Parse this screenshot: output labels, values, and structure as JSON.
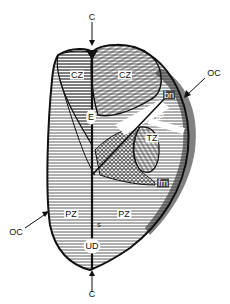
{
  "figure": {
    "type": "anatomical-diagram",
    "colors": {
      "outline": "#111111",
      "hatch": "#333333",
      "fibromuscular": "#6b6b6b",
      "background": "#ffffff"
    },
    "labels": {
      "c_top": "C",
      "c_bottom": "C",
      "oc_right": "OC",
      "oc_left": "OC",
      "cz_left": "CZ",
      "cz_right": "CZ",
      "e": "E",
      "bn": "bn",
      "s_upper": "s",
      "up": "UP",
      "tz": "TZ",
      "fm": "fm",
      "pz_left": "PZ",
      "pz_right": "PZ",
      "s_lower": "s",
      "ud": "UD"
    }
  }
}
